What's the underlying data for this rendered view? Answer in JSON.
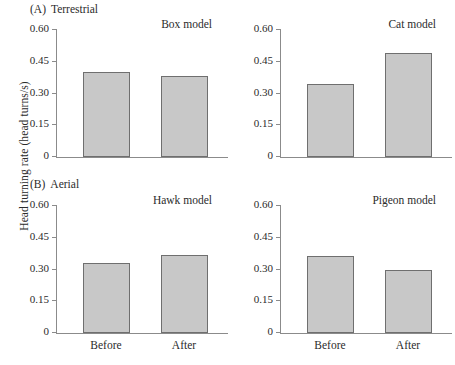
{
  "figure": {
    "ylabel": "Head turning rate (head turns/s)",
    "sections": [
      {
        "tag": "(A)",
        "name": "Terrestrial"
      },
      {
        "tag": "(B)",
        "name": "Aerial"
      }
    ]
  },
  "axis": {
    "ytick_labels": [
      "0.60",
      "0.45",
      "0.30",
      "0.15",
      "0"
    ],
    "ytick_values": [
      0.6,
      0.45,
      0.3,
      0.15,
      0
    ],
    "xtick_labels": [
      "Before",
      "After"
    ]
  },
  "panels": [
    {
      "title": "Box model",
      "values": [
        0.4,
        0.385
      ]
    },
    {
      "title": "Cat model",
      "values": [
        0.345,
        0.49
      ]
    },
    {
      "title": "Hawk model",
      "values": [
        0.33,
        0.37
      ]
    },
    {
      "title": "Pigeon model",
      "values": [
        0.365,
        0.3
      ]
    }
  ],
  "style": {
    "bar_fill": "#c8c8c8",
    "bar_stroke": "#6f6f6f",
    "axis_color": "#8b8b8b",
    "text_color": "#2b2b2b"
  },
  "chart_data": {
    "type": "bar",
    "title": "",
    "xlabel": "",
    "ylabel": "Head turning rate (head turns/s)",
    "ylim": [
      0,
      0.6
    ],
    "yticks": [
      0,
      0.15,
      0.3,
      0.45,
      0.6
    ],
    "grid": false,
    "legend": "none",
    "categories": [
      "Before",
      "After"
    ],
    "panels": [
      {
        "section": "(A) Terrestrial",
        "title": "Box model",
        "categories": [
          "Before",
          "After"
        ],
        "values": [
          0.4,
          0.385
        ]
      },
      {
        "section": "(A) Terrestrial",
        "title": "Cat model",
        "categories": [
          "Before",
          "After"
        ],
        "values": [
          0.345,
          0.49
        ]
      },
      {
        "section": "(B) Aerial",
        "title": "Hawk model",
        "categories": [
          "Before",
          "After"
        ],
        "values": [
          0.33,
          0.37
        ]
      },
      {
        "section": "(B) Aerial",
        "title": "Pigeon model",
        "categories": [
          "Before",
          "After"
        ],
        "values": [
          0.365,
          0.3
        ]
      }
    ]
  }
}
